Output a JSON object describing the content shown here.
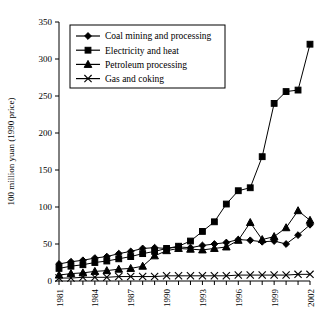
{
  "chart_data": {
    "type": "line",
    "title": "",
    "xlabel": "",
    "ylabel": "100 million yuan (1990 price)",
    "ylim": [
      0,
      350
    ],
    "ytick_step": 50,
    "yticks": [
      "0",
      "50",
      "100",
      "150",
      "200",
      "250",
      "300",
      "350"
    ],
    "grid": false,
    "legend_position": "top-left",
    "x": [
      1981,
      1982,
      1983,
      1984,
      1985,
      1986,
      1987,
      1988,
      1989,
      1990,
      1991,
      1992,
      1993,
      1994,
      1995,
      1996,
      1997,
      1998,
      1999,
      2000,
      2001,
      2002
    ],
    "xtick_labels": [
      "1981",
      "1984",
      "1987",
      "1990",
      "1993",
      "1996",
      "1999",
      "2002"
    ],
    "xtick_label_years": [
      1981,
      1984,
      1987,
      1990,
      1993,
      1996,
      1999,
      2002
    ],
    "series": [
      {
        "name": "Coal mining and processing",
        "marker": "diamond",
        "values": [
          23,
          26,
          28,
          31,
          33,
          37,
          40,
          44,
          45,
          44,
          46,
          45,
          48,
          50,
          52,
          56,
          55,
          53,
          54,
          50,
          62,
          76
        ]
      },
      {
        "name": "Electricity and heat",
        "marker": "square",
        "values": [
          17,
          20,
          22,
          25,
          27,
          30,
          33,
          37,
          40,
          44,
          47,
          54,
          67,
          80,
          104,
          122,
          126,
          168,
          240,
          256,
          258,
          320
        ]
      },
      {
        "name": "Petroleum processing",
        "marker": "triangle",
        "values": [
          8,
          10,
          11,
          13,
          14,
          16,
          17,
          20,
          34,
          41,
          44,
          43,
          42,
          44,
          46,
          55,
          79,
          56,
          60,
          72,
          95,
          82
        ]
      },
      {
        "name": "Gas and coking",
        "marker": "cross",
        "values": [
          4,
          4,
          5,
          5,
          5,
          6,
          6,
          6,
          6,
          7,
          7,
          7,
          7,
          7,
          7,
          8,
          8,
          8,
          8,
          8,
          9,
          9
        ]
      }
    ]
  }
}
